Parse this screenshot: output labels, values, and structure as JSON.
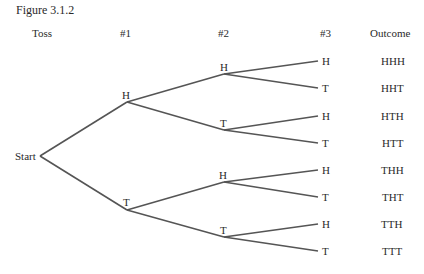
{
  "figure_title": "Figure 3.1.2",
  "headers": {
    "toss": "Toss",
    "t1": "#1",
    "t2": "#2",
    "t3": "#3",
    "outcome": "Outcome"
  },
  "start_label": "Start",
  "level1": [
    {
      "label": "H",
      "x": 127,
      "y": 102
    },
    {
      "label": "T",
      "x": 127,
      "y": 210
    }
  ],
  "level2": [
    {
      "label": "H",
      "x": 224,
      "y": 74
    },
    {
      "label": "T",
      "x": 224,
      "y": 130
    },
    {
      "label": "H",
      "x": 224,
      "y": 182
    },
    {
      "label": "T",
      "x": 224,
      "y": 237
    }
  ],
  "level3": [
    "H",
    "T",
    "H",
    "T",
    "H",
    "T",
    "H",
    "T"
  ],
  "outcomes": [
    "HHH",
    "HHT",
    "HTH",
    "HTT",
    "THH",
    "THT",
    "TTH",
    "TTT"
  ],
  "edge_color": "#555555"
}
